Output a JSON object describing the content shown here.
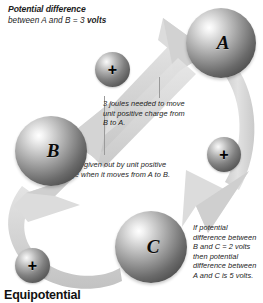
{
  "figure": {
    "title": {
      "line1": "Potential difference",
      "line2_prefix": "between A and B = 3 ",
      "line2_bold": "volts"
    },
    "footer_caption": "Equipotential",
    "annotations": {
      "b_to_a": "3 joules needed to move unit positive charge from B to A.",
      "a_to_b": "3 joules given out by unit positive charge when it moves from A to B.",
      "a_to_c": "If potential difference between B and C = 2 volts then potential difference between A and C is 5 volts."
    },
    "spheres": [
      {
        "id": "A",
        "label": "A"
      },
      {
        "id": "B",
        "label": "B"
      },
      {
        "id": "C",
        "label": "C"
      }
    ],
    "charges": [
      {
        "id": "charge-top",
        "label": "+"
      },
      {
        "id": "charge-right",
        "label": "+"
      },
      {
        "id": "charge-bottom",
        "label": "+"
      }
    ],
    "colors": {
      "background": "#ffffff",
      "arrow": "#d9d9d9",
      "arrow_shade": "#c4c4c4",
      "sphere_highlight": "#f2f2f2",
      "sphere_dark": "#3c3c3c",
      "text": "#1c1c1c",
      "leader_line": "#9a9a9a"
    }
  }
}
